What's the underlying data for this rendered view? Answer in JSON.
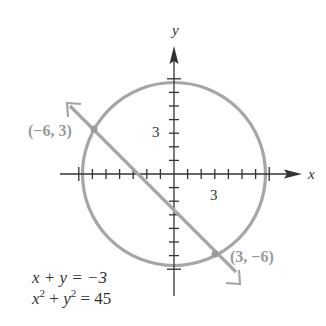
{
  "chart_data": {
    "type": "line",
    "title": "",
    "xlabel": "x",
    "ylabel": "y",
    "xlim": [
      -7,
      7
    ],
    "ylim": [
      -7,
      7
    ],
    "grid": false,
    "tick_step": 1,
    "tick_labels": {
      "x": [
        "3"
      ],
      "y": [
        "3"
      ]
    },
    "series": [
      {
        "name": "circle",
        "equation": "x^2 + y^2 = 45",
        "kind": "circle",
        "center": [
          0,
          0
        ],
        "radius": 6.708
      },
      {
        "name": "line",
        "equation": "x + y = -3",
        "kind": "line",
        "slope": -1,
        "intercept": -3
      }
    ],
    "intersection_points": [
      {
        "label": "(−6, 3)",
        "x": -6,
        "y": 3
      },
      {
        "label": "(3, −6)",
        "x": 3,
        "y": -6
      }
    ],
    "annotations": [
      "x + y = −3",
      "x² + y² = 45"
    ]
  },
  "labels": {
    "x_axis": "x",
    "y_axis": "y",
    "x_tick": "3",
    "y_tick": "3",
    "point1": "(−6, 3)",
    "point2": "(3, −6)",
    "eq1": "x + y = −3",
    "eq2_base_x": "x",
    "eq2_exp": "2",
    "eq2_plus": " + ",
    "eq2_base_y": "y",
    "eq2_rhs": " = 45"
  },
  "colors": {
    "axis": "#333333",
    "curve": "#a6a6a6",
    "point_label": "#9a9a9a",
    "text": "#333333"
  }
}
